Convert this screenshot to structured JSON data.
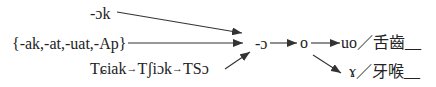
{
  "diagram": {
    "sources": {
      "ok": "-ɔk",
      "group": "{-ak,-at,-uat,-Ap}",
      "chain": {
        "steps": [
          "Tɕiak",
          "Tʃiɔk",
          "TSɔ"
        ],
        "arrow": "→"
      }
    },
    "hub": "-ɔ",
    "mid": "o",
    "outcomes": [
      {
        "reflex": "uo",
        "separator": "／",
        "environment": "舌齒",
        "blank": "__"
      },
      {
        "reflex": "ɤ",
        "separator": "／",
        "environment": "牙喉",
        "blank": "__"
      }
    ],
    "edges": [
      {
        "from": "-ɔk",
        "to": "-ɔ"
      },
      {
        "from": "{-ak,-at,-uat,-Ap}",
        "to": "-ɔ"
      },
      {
        "from": "TSɔ",
        "to": "-ɔ"
      },
      {
        "from": "-ɔ",
        "to": "o"
      },
      {
        "from": "o",
        "to": "uo"
      },
      {
        "from": "o",
        "to": "ɤ"
      }
    ],
    "colors": {
      "text": "#222222",
      "line": "#333333",
      "background": "#ffffff"
    }
  }
}
